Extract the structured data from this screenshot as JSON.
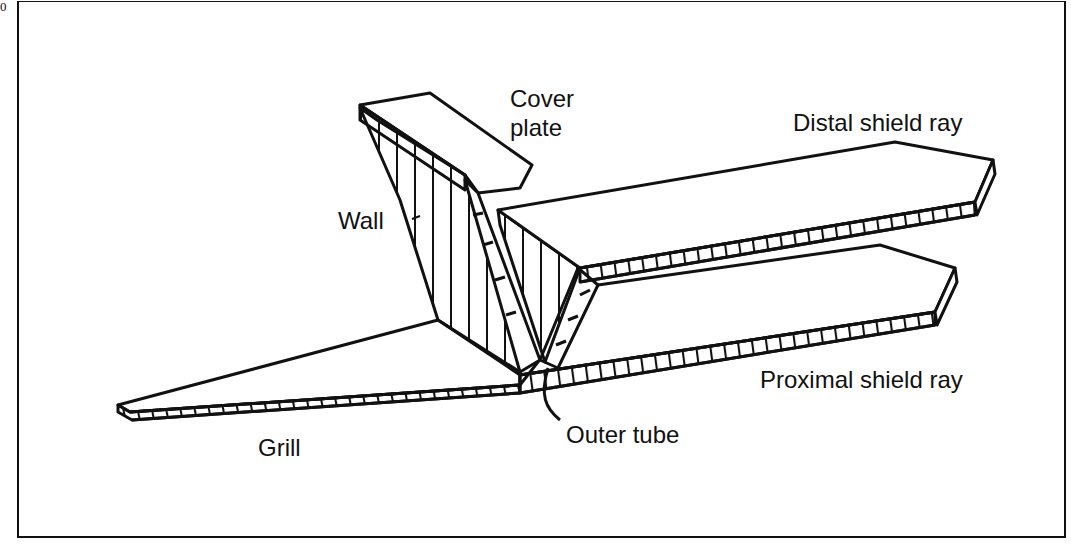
{
  "figure": {
    "corner_mark": "0",
    "labels": {
      "cover_plate": "Cover\nplate",
      "distal_shield_ray": "Distal shield ray",
      "wall": "Wall",
      "proximal_shield_ray": "Proximal shield ray",
      "outer_tube": "Outer tube",
      "grill": "Grill"
    },
    "colors": {
      "ink": "#111111",
      "paper": "#ffffff"
    }
  }
}
